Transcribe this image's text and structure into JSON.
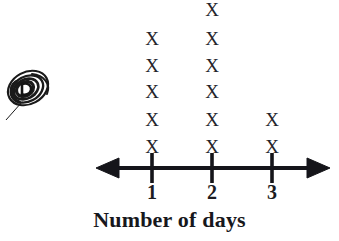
{
  "chart_data": {
    "type": "bar",
    "plot_style": "dot-plot-x-marks",
    "title": "",
    "subtitle": "",
    "xlabel": "Number of days",
    "ylabel": "",
    "categories": [
      "1",
      "2",
      "3"
    ],
    "values": [
      5,
      6,
      2
    ],
    "tick_labels": [
      "1",
      "2",
      "3"
    ],
    "mark_glyph": "X",
    "series": [
      {
        "name": "Number of days",
        "values": [
          5,
          6,
          2
        ]
      }
    ],
    "axis": {
      "orientation": "horizontal",
      "double_headed_arrow": true,
      "line_y": 168,
      "left_end_x": 96,
      "right_end_x": 330,
      "tick_positions_px": [
        152,
        212,
        272
      ],
      "tick_spacing_px": 60,
      "grid": false,
      "legend": "none"
    }
  },
  "marks": {
    "glyph": "X",
    "color": "#24242a",
    "columns": [
      {
        "category": "1",
        "x_px": 152,
        "count": 5,
        "rows_y_px": [
          29,
          56,
          82,
          110,
          137
        ]
      },
      {
        "category": "2",
        "x_px": 212,
        "count": 6,
        "rows_y_px": [
          0,
          29,
          56,
          82,
          110,
          137
        ]
      },
      {
        "category": "3",
        "x_px": 272,
        "count": 2,
        "rows_y_px": [
          110,
          137
        ]
      }
    ]
  },
  "annotation": {
    "name": "hand-drawn-circled-mark",
    "description": "Hand-drawn spiral/oval scribble circling a letter at the left of the figure",
    "color": "#1a1a1a",
    "x_px": 2,
    "y_px": 62
  },
  "colors": {
    "background": "#ffffff",
    "ink": "#17171c",
    "mark": "#24242a",
    "axis": "#15151a"
  }
}
